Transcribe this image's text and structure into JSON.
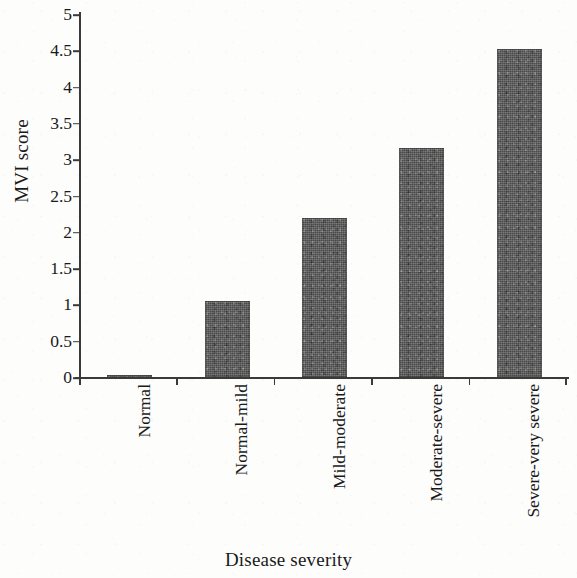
{
  "chart_data": {
    "type": "bar",
    "title": "",
    "xlabel": "Disease severity",
    "ylabel": "MVI score",
    "categories": [
      "Normal",
      "Normal-mild",
      "Mild-moderate",
      "Moderate-severe",
      "Severe-very severe"
    ],
    "values": [
      0.01,
      1.05,
      2.19,
      3.15,
      4.52
    ],
    "ylim": [
      0,
      5
    ],
    "ytick_labels": [
      "5",
      "4.5",
      "4",
      "3.5",
      "3",
      "2.5",
      "2",
      "1.5",
      "1",
      "0.5",
      "0"
    ],
    "ytick_values": [
      5,
      4.5,
      4,
      3.5,
      3,
      2.5,
      2,
      1.5,
      1,
      0.5,
      0
    ],
    "grid": false,
    "legend": null,
    "legend_position": "none",
    "bar_color": "#5a5a5a",
    "axis_color": "#3a3a3a",
    "background_color": "#fdfdfc"
  }
}
